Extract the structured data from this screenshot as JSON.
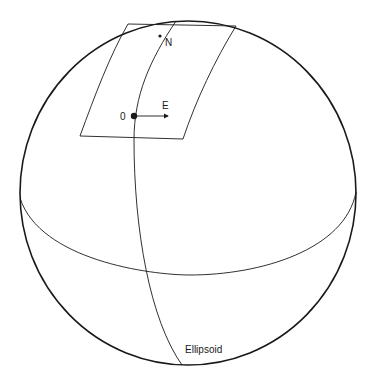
{
  "diagram": {
    "labels": {
      "north": "N",
      "east": "E",
      "origin": "0",
      "ellipsoid": "Ellipsoid"
    },
    "colors": {
      "stroke": "#1a1a1a",
      "background": "#ffffff"
    }
  }
}
